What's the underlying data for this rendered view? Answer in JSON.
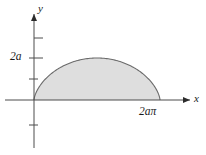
{
  "figure": {
    "title": "",
    "background_color": "#ffffff"
  },
  "axes": {
    "x_axis_label": "x",
    "y_axis_label": "y",
    "axis_color": "#4d4d4d",
    "origin_label": ""
  },
  "tick_labels": {
    "y_2a": "2a",
    "x_2api": "2aπ"
  },
  "region": {
    "fill_color": "#dedede",
    "stroke_color": "#6b6b6b"
  },
  "chart_data": {
    "type": "area",
    "title": "",
    "xlabel": "x",
    "ylabel": "y",
    "curve": "cycloid arch",
    "parametric": {
      "x": "a(t - sin t)",
      "y": "a(1 - cos t)",
      "t_range": [
        0,
        6.283185307179586
      ]
    },
    "x_tick_labels": [
      "2aπ"
    ],
    "x_tick_values": [
      6.283185307179586
    ],
    "y_tick_labels": [
      "2a"
    ],
    "y_tick_values": [
      2
    ],
    "xlim": [
      -1.2,
      8.2
    ],
    "ylim": [
      -2.2,
      3.4
    ],
    "shaded_region": {
      "from": 0,
      "to": 6.283185307179586,
      "between": [
        "cycloid arch",
        "x-axis"
      ],
      "fill": "#dedede"
    },
    "grid": false,
    "legend": null,
    "annotations": [
      {
        "text": "2a",
        "position": "y-axis tick",
        "value": 2
      },
      {
        "text": "2aπ",
        "position": "x-axis tick",
        "value": 6.283185307179586
      },
      {
        "text": "x",
        "position": "x-axis arrow end"
      },
      {
        "text": "y",
        "position": "y-axis arrow end"
      }
    ],
    "series": [
      {
        "name": "cycloid arch",
        "x": [
          0.0,
          0.0113,
          0.0896,
          0.2978,
          0.6882,
          1.2976,
          2.1468,
          3.1416,
          4.1364,
          4.9856,
          5.595,
          5.9854,
          6.1936,
          6.2719,
          6.2832
        ],
        "y": [
          0.0,
          0.0489,
          0.191,
          0.4142,
          0.7154,
          1.0824,
          1.4946,
          2.0,
          2.4946,
          2.9176,
          3.2846,
          3.5858,
          3.809,
          3.9511,
          4.0
        ]
      }
    ]
  }
}
